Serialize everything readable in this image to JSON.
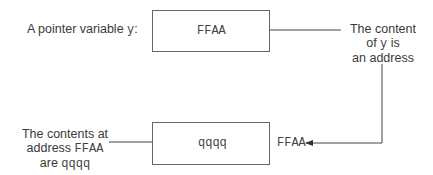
{
  "top": {
    "label_prefix": "A pointer variable ",
    "label_var": "y",
    "label_suffix": ":",
    "box_value": "FFAA"
  },
  "annotation_right": {
    "line1": "The content",
    "line2_prefix": "of ",
    "line2_var": "y",
    "line2_suffix": " is",
    "line3": "an address"
  },
  "bottom": {
    "box_value": "qqqq",
    "address_label": "FFAA"
  },
  "annotation_left": {
    "line1": "The contents at",
    "line2_prefix": "address ",
    "line2_addr": "FFAA",
    "line3_prefix": "are ",
    "line3_value": "qqqq"
  },
  "colors": {
    "line": "#444444",
    "box_border": "#666666"
  }
}
